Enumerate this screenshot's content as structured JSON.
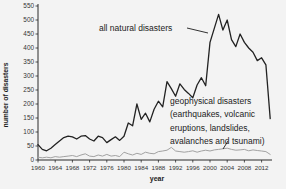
{
  "chart_data": {
    "type": "line",
    "title": "",
    "xlabel": "year",
    "ylabel": "number of disasters",
    "x_start": 1960,
    "x_end": 2014,
    "ylim": [
      0,
      550
    ],
    "grid": false,
    "legend_position": "none (inline annotations with leader lines)",
    "xticks": [
      1960,
      1964,
      1968,
      1972,
      1976,
      1980,
      1984,
      1988,
      1992,
      1996,
      2000,
      2004,
      2008,
      2012
    ],
    "yticks": [
      0,
      50,
      100,
      150,
      200,
      250,
      300,
      350,
      400,
      450,
      500,
      550
    ],
    "series": [
      {
        "name": "all natural disasters",
        "color": "#222222",
        "stroke_width": 1.3,
        "values": [
          55,
          38,
          33,
          42,
          55,
          68,
          80,
          85,
          83,
          75,
          85,
          87,
          75,
          68,
          85,
          80,
          62,
          73,
          83,
          70,
          85,
          132,
          122,
          200,
          145,
          167,
          136,
          181,
          210,
          190,
          280,
          255,
          228,
          272,
          252,
          238,
          222,
          268,
          294,
          265,
          420,
          470,
          520,
          464,
          500,
          430,
          405,
          450,
          420,
          400,
          385,
          355,
          365,
          340,
          148
        ]
      },
      {
        "name": "geophysical disasters (earthquakes, volcanic eruptions, landslides, avalanches and tsunami)",
        "color": "#a2a2a2",
        "stroke_width": 1,
        "values": [
          10,
          8,
          10,
          8,
          12,
          10,
          12,
          14,
          16,
          12,
          18,
          22,
          14,
          12,
          18,
          14,
          20,
          14,
          16,
          12,
          28,
          22,
          18,
          24,
          20,
          28,
          24,
          22,
          30,
          32,
          35,
          45,
          32,
          30,
          28,
          30,
          33,
          28,
          32,
          35,
          32,
          36,
          38,
          40,
          42,
          38,
          35,
          36,
          38,
          33,
          36,
          34,
          32,
          30,
          20
        ]
      }
    ],
    "annotations": {
      "all_natural": {
        "label": "all natural disasters"
      },
      "geophysical": {
        "lines": {
          "0": "geophysical disasters",
          "1": "(earthquakes, volcanic",
          "2": "eruptions, landslides,",
          "3": "avalanches and tsunami)"
        }
      }
    },
    "axis_color": "#2a2a2a",
    "tick_label_color": "#333333",
    "background_color": "#f3f3f3"
  }
}
